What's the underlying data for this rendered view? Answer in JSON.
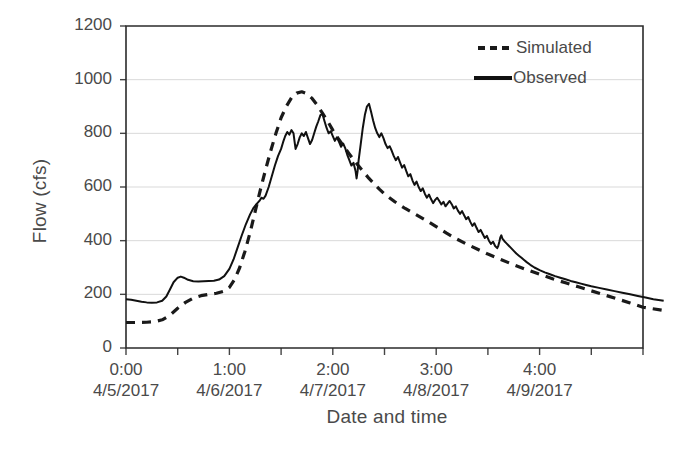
{
  "chart_data": {
    "type": "line",
    "title": "",
    "xlabel": "Date and time",
    "ylabel": "Flow (cfs)",
    "ylim": [
      0,
      1200
    ],
    "yticks": [
      0,
      200,
      400,
      600,
      800,
      1000,
      1200
    ],
    "ytick_labels": [
      "0",
      "200",
      "400",
      "600",
      "800",
      "1000",
      "1200"
    ],
    "xlim": [
      0,
      10
    ],
    "xticks": [
      0,
      1,
      2,
      3,
      4,
      5,
      6,
      7,
      8,
      9,
      10
    ],
    "xtick_labels": [
      {
        "time": "0:00",
        "date": "4/5/2017",
        "pos": 0
      },
      {
        "time": "1:00",
        "date": "4/6/2017",
        "pos": 2
      },
      {
        "time": "2:00",
        "date": "4/7/2017",
        "pos": 4
      },
      {
        "time": "3:00",
        "date": "4/8/2017",
        "pos": 6
      },
      {
        "time": "4:00",
        "date": "4/9/2017",
        "pos": 8
      }
    ],
    "grid": "horizontal",
    "legend_position": "top-right",
    "series": [
      {
        "name": "Simulated",
        "style": "dashed",
        "color": "#1a1a1a",
        "points": [
          [
            0.0,
            95
          ],
          [
            0.2,
            95
          ],
          [
            0.4,
            96
          ],
          [
            0.55,
            98
          ],
          [
            0.7,
            105
          ],
          [
            0.85,
            122
          ],
          [
            1.0,
            148
          ],
          [
            1.15,
            170
          ],
          [
            1.3,
            186
          ],
          [
            1.45,
            195
          ],
          [
            1.6,
            200
          ],
          [
            1.75,
            204
          ],
          [
            1.9,
            212
          ],
          [
            2.0,
            226
          ],
          [
            2.1,
            255
          ],
          [
            2.2,
            300
          ],
          [
            2.3,
            360
          ],
          [
            2.4,
            430
          ],
          [
            2.5,
            510
          ],
          [
            2.6,
            590
          ],
          [
            2.7,
            665
          ],
          [
            2.8,
            735
          ],
          [
            2.9,
            800
          ],
          [
            3.0,
            858
          ],
          [
            3.1,
            900
          ],
          [
            3.2,
            932
          ],
          [
            3.3,
            950
          ],
          [
            3.4,
            955
          ],
          [
            3.5,
            948
          ],
          [
            3.6,
            930
          ],
          [
            3.7,
            905
          ],
          [
            3.8,
            875
          ],
          [
            3.9,
            845
          ],
          [
            4.0,
            812
          ],
          [
            4.1,
            782
          ],
          [
            4.2,
            755
          ],
          [
            4.3,
            728
          ],
          [
            4.4,
            702
          ],
          [
            4.5,
            678
          ],
          [
            4.6,
            655
          ],
          [
            4.7,
            632
          ],
          [
            4.8,
            612
          ],
          [
            4.9,
            592
          ],
          [
            5.0,
            574
          ],
          [
            5.2,
            545
          ],
          [
            5.4,
            520
          ],
          [
            5.6,
            498
          ],
          [
            5.8,
            476
          ],
          [
            6.0,
            452
          ],
          [
            6.2,
            428
          ],
          [
            6.4,
            406
          ],
          [
            6.6,
            386
          ],
          [
            6.8,
            368
          ],
          [
            7.0,
            350
          ],
          [
            7.25,
            330
          ],
          [
            7.5,
            310
          ],
          [
            7.75,
            292
          ],
          [
            8.0,
            275
          ],
          [
            8.25,
            258
          ],
          [
            8.5,
            243
          ],
          [
            8.75,
            228
          ],
          [
            9.0,
            213
          ],
          [
            9.25,
            198
          ],
          [
            9.5,
            183
          ],
          [
            9.75,
            168
          ],
          [
            10.0,
            152
          ],
          [
            10.4,
            140
          ]
        ]
      },
      {
        "name": "Observed",
        "style": "solid",
        "color": "#111111",
        "points": [
          [
            0.0,
            182
          ],
          [
            0.1,
            180
          ],
          [
            0.2,
            176
          ],
          [
            0.3,
            172
          ],
          [
            0.4,
            170
          ],
          [
            0.5,
            169
          ],
          [
            0.6,
            170
          ],
          [
            0.7,
            176
          ],
          [
            0.78,
            192
          ],
          [
            0.85,
            218
          ],
          [
            0.92,
            245
          ],
          [
            1.0,
            262
          ],
          [
            1.06,
            266
          ],
          [
            1.12,
            262
          ],
          [
            1.2,
            254
          ],
          [
            1.3,
            249
          ],
          [
            1.4,
            248
          ],
          [
            1.5,
            249
          ],
          [
            1.6,
            250
          ],
          [
            1.7,
            251
          ],
          [
            1.8,
            255
          ],
          [
            1.9,
            268
          ],
          [
            2.0,
            295
          ],
          [
            2.08,
            330
          ],
          [
            2.16,
            375
          ],
          [
            2.24,
            420
          ],
          [
            2.32,
            462
          ],
          [
            2.4,
            498
          ],
          [
            2.46,
            520
          ],
          [
            2.52,
            535
          ],
          [
            2.58,
            548
          ],
          [
            2.62,
            560
          ],
          [
            2.66,
            556
          ],
          [
            2.7,
            568
          ],
          [
            2.76,
            600
          ],
          [
            2.82,
            640
          ],
          [
            2.88,
            680
          ],
          [
            2.94,
            715
          ],
          [
            3.0,
            742
          ],
          [
            3.04,
            768
          ],
          [
            3.08,
            790
          ],
          [
            3.12,
            805
          ],
          [
            3.16,
            795
          ],
          [
            3.2,
            812
          ],
          [
            3.24,
            800
          ],
          [
            3.26,
            770
          ],
          [
            3.28,
            742
          ],
          [
            3.32,
            760
          ],
          [
            3.36,
            785
          ],
          [
            3.4,
            800
          ],
          [
            3.44,
            790
          ],
          [
            3.48,
            805
          ],
          [
            3.52,
            782
          ],
          [
            3.56,
            760
          ],
          [
            3.6,
            775
          ],
          [
            3.64,
            800
          ],
          [
            3.68,
            825
          ],
          [
            3.72,
            845
          ],
          [
            3.76,
            868
          ],
          [
            3.8,
            872
          ],
          [
            3.84,
            845
          ],
          [
            3.88,
            820
          ],
          [
            3.92,
            800
          ],
          [
            3.96,
            808
          ],
          [
            4.0,
            790
          ],
          [
            4.04,
            772
          ],
          [
            4.08,
            785
          ],
          [
            4.12,
            768
          ],
          [
            4.16,
            750
          ],
          [
            4.2,
            762
          ],
          [
            4.24,
            745
          ],
          [
            4.28,
            720
          ],
          [
            4.32,
            700
          ],
          [
            4.36,
            680
          ],
          [
            4.4,
            690
          ],
          [
            4.44,
            660
          ],
          [
            4.46,
            632
          ],
          [
            4.48,
            660
          ],
          [
            4.5,
            700
          ],
          [
            4.54,
            760
          ],
          [
            4.58,
            820
          ],
          [
            4.62,
            868
          ],
          [
            4.66,
            900
          ],
          [
            4.7,
            910
          ],
          [
            4.74,
            880
          ],
          [
            4.78,
            848
          ],
          [
            4.82,
            820
          ],
          [
            4.86,
            800
          ],
          [
            4.9,
            786
          ],
          [
            4.94,
            800
          ],
          [
            4.98,
            782
          ],
          [
            5.02,
            760
          ],
          [
            5.06,
            745
          ],
          [
            5.1,
            752
          ],
          [
            5.14,
            735
          ],
          [
            5.18,
            715
          ],
          [
            5.22,
            700
          ],
          [
            5.26,
            712
          ],
          [
            5.3,
            692
          ],
          [
            5.34,
            672
          ],
          [
            5.38,
            682
          ],
          [
            5.42,
            660
          ],
          [
            5.46,
            640
          ],
          [
            5.5,
            648
          ],
          [
            5.54,
            625
          ],
          [
            5.58,
            608
          ],
          [
            5.62,
            620
          ],
          [
            5.66,
            600
          ],
          [
            5.7,
            585
          ],
          [
            5.74,
            595
          ],
          [
            5.78,
            575
          ],
          [
            5.82,
            560
          ],
          [
            5.86,
            572
          ],
          [
            5.9,
            555
          ],
          [
            5.94,
            540
          ],
          [
            5.98,
            552
          ],
          [
            6.02,
            560
          ],
          [
            6.06,
            548
          ],
          [
            6.1,
            535
          ],
          [
            6.14,
            545
          ],
          [
            6.18,
            528
          ],
          [
            6.22,
            538
          ],
          [
            6.26,
            548
          ],
          [
            6.3,
            536
          ],
          [
            6.34,
            520
          ],
          [
            6.38,
            528
          ],
          [
            6.42,
            512
          ],
          [
            6.46,
            500
          ],
          [
            6.5,
            510
          ],
          [
            6.54,
            495
          ],
          [
            6.58,
            480
          ],
          [
            6.62,
            488
          ],
          [
            6.66,
            470
          ],
          [
            6.7,
            455
          ],
          [
            6.74,
            465
          ],
          [
            6.78,
            448
          ],
          [
            6.82,
            432
          ],
          [
            6.86,
            440
          ],
          [
            6.9,
            425
          ],
          [
            6.94,
            410
          ],
          [
            6.98,
            418
          ],
          [
            7.02,
            400
          ],
          [
            7.06,
            388
          ],
          [
            7.1,
            396
          ],
          [
            7.14,
            380
          ],
          [
            7.18,
            372
          ],
          [
            7.2,
            380
          ],
          [
            7.22,
            395
          ],
          [
            7.24,
            412
          ],
          [
            7.26,
            420
          ],
          [
            7.28,
            408
          ],
          [
            7.32,
            398
          ],
          [
            7.36,
            390
          ],
          [
            7.4,
            382
          ],
          [
            7.45,
            372
          ],
          [
            7.5,
            362
          ],
          [
            7.55,
            352
          ],
          [
            7.6,
            344
          ],
          [
            7.65,
            336
          ],
          [
            7.7,
            328
          ],
          [
            7.75,
            320
          ],
          [
            7.82,
            310
          ],
          [
            7.9,
            300
          ],
          [
            8.0,
            290
          ],
          [
            8.1,
            282
          ],
          [
            8.2,
            275
          ],
          [
            8.3,
            268
          ],
          [
            8.4,
            262
          ],
          [
            8.5,
            256
          ],
          [
            8.6,
            250
          ],
          [
            8.7,
            245
          ],
          [
            8.8,
            240
          ],
          [
            8.9,
            235
          ],
          [
            9.0,
            230
          ],
          [
            9.15,
            224
          ],
          [
            9.3,
            218
          ],
          [
            9.45,
            212
          ],
          [
            9.6,
            206
          ],
          [
            9.75,
            200
          ],
          [
            9.9,
            194
          ],
          [
            10.05,
            188
          ],
          [
            10.2,
            182
          ],
          [
            10.4,
            176
          ]
        ]
      }
    ]
  },
  "legend": {
    "items": [
      {
        "label": "Simulated",
        "style": "dashed"
      },
      {
        "label": "Observed",
        "style": "solid"
      }
    ]
  }
}
